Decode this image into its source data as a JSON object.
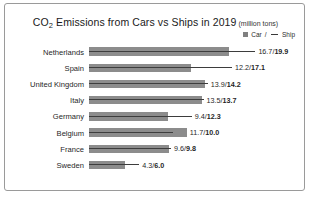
{
  "chart_data": {
    "type": "bar",
    "orientation": "horizontal",
    "title": "CO2 Emissions from Cars vs Ships in 2019",
    "title_main": "CO",
    "title_sub": "2",
    "title_rest": " Emissions from Cars vs Ships in 2019",
    "units": "(million tons)",
    "xlabel": "",
    "ylabel": "",
    "grid": false,
    "legend_position": "top-right",
    "categories": [
      "Netherlands",
      "Spain",
      "United Kingdom",
      "Italy",
      "Germany",
      "Belgium",
      "France",
      "Sweden"
    ],
    "series": [
      {
        "name": "Car",
        "values": [
          16.7,
          12.2,
          13.9,
          13.5,
          9.4,
          11.7,
          9.6,
          4.3
        ]
      },
      {
        "name": "Ship",
        "values": [
          19.9,
          17.1,
          14.2,
          13.7,
          12.3,
          10.0,
          9.8,
          6.0
        ]
      }
    ],
    "xlim": [
      0,
      19.9
    ]
  },
  "legend": {
    "car_label": "Car",
    "separator": "/",
    "ship_label": "Ship"
  },
  "colors": {
    "car_bar": "#8c8c8c",
    "ship_line": "#3d3d3d",
    "frame_border": "#9a9a9a",
    "background": "#ffffff",
    "text": "#1f1f1f"
  },
  "rows": [
    {
      "country": "Netherlands",
      "car": 16.7,
      "ship": 19.9,
      "car_text": "16.7",
      "ship_text": "19.9"
    },
    {
      "country": "Spain",
      "car": 12.2,
      "ship": 17.1,
      "car_text": "12.2",
      "ship_text": "17.1"
    },
    {
      "country": "United Kingdom",
      "car": 13.9,
      "ship": 14.2,
      "car_text": "13.9",
      "ship_text": "14.2"
    },
    {
      "country": "Italy",
      "car": 13.5,
      "ship": 13.7,
      "car_text": "13.5",
      "ship_text": "13.7"
    },
    {
      "country": "Germany",
      "car": 9.4,
      "ship": 12.3,
      "car_text": "9.4",
      "ship_text": "12.3"
    },
    {
      "country": "Belgium",
      "car": 11.7,
      "ship": 10.0,
      "car_text": "11.7",
      "ship_text": "10.0"
    },
    {
      "country": "France",
      "car": 9.6,
      "ship": 9.8,
      "car_text": "9.6",
      "ship_text": "9.8"
    },
    {
      "country": "Sweden",
      "car": 4.3,
      "ship": 6.0,
      "car_text": "4.3",
      "ship_text": "6.0"
    }
  ]
}
